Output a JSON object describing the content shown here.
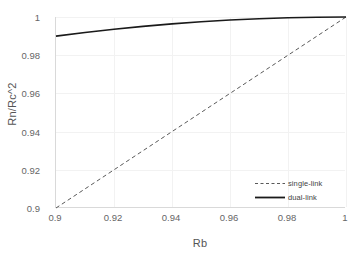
{
  "chart_data": {
    "type": "line",
    "title": "",
    "subtitle": "",
    "xlabel": "Rb",
    "ylabel": "Rn/Rc^2",
    "xlim": [
      0.9,
      1.0
    ],
    "ylim": [
      0.9,
      1.0
    ],
    "xticks": [
      "0.9",
      "0.92",
      "0.94",
      "0.96",
      "0.98",
      "1"
    ],
    "xtick_values": [
      0.9,
      0.92,
      0.94,
      0.96,
      0.98,
      1.0
    ],
    "yticks": [
      "0.9",
      "0.92",
      "0.94",
      "0.96",
      "0.98",
      "1"
    ],
    "ytick_values": [
      0.9,
      0.92,
      0.94,
      0.96,
      0.98,
      1.0
    ],
    "grid": true,
    "legend_position": "lower-right",
    "x": [
      0.9,
      0.91,
      0.92,
      0.93,
      0.94,
      0.95,
      0.96,
      0.97,
      0.98,
      0.99,
      1.0
    ],
    "series": [
      {
        "name": "single-link",
        "style": "dashed",
        "color": "#595959",
        "values": [
          0.9,
          0.91,
          0.92,
          0.93,
          0.94,
          0.95,
          0.96,
          0.97,
          0.98,
          0.99,
          1.0
        ]
      },
      {
        "name": "dual-link",
        "style": "solid",
        "color": "#1a1a1a",
        "values": [
          0.99,
          0.9919,
          0.9936,
          0.9951,
          0.9964,
          0.9975,
          0.9984,
          0.9991,
          0.9996,
          0.9999,
          1.0
        ]
      }
    ],
    "annotations": []
  },
  "colors": {
    "background": "#ffffff",
    "axis": "#d9d9d9",
    "grid": "#f2f2f2",
    "tick_text": "#666666",
    "axis_title": "#555555",
    "single_link": "#595959",
    "dual_link": "#1a1a1a"
  }
}
